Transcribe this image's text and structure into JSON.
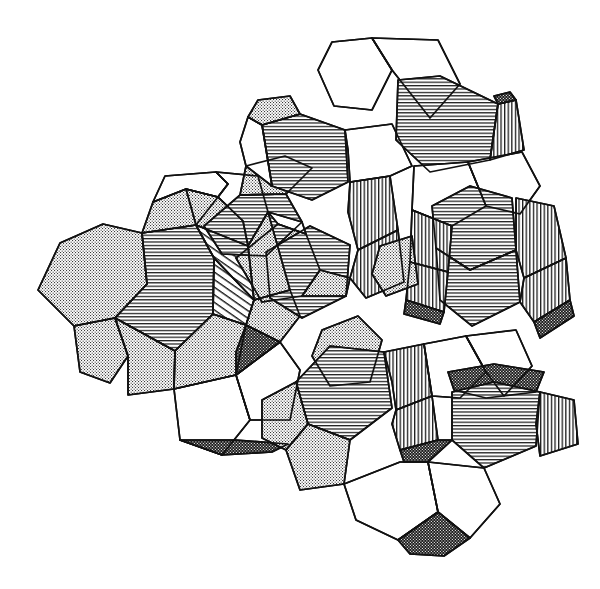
{
  "figure": {
    "title": "Cluster of interpenetrating truncated polyhedra",
    "background_color": "#ffffff",
    "line_color": "#111111",
    "canvas": {
      "width": 600,
      "height": 589
    },
    "drawing_bounds": {
      "left": 37,
      "top": 38,
      "right": 578,
      "bottom": 556
    }
  },
  "legend": {
    "fill_styles": [
      {
        "key": "white",
        "label": "plain white face",
        "color": "#ffffff"
      },
      {
        "key": "stipple",
        "label": "light stipple face",
        "color": "#d9d9d9"
      },
      {
        "key": "horizontal",
        "label": "horizontal hatch face",
        "color": "#2a2a2a"
      },
      {
        "key": "diagonal",
        "label": "diagonal hatch face",
        "color": "#1f1f1f"
      },
      {
        "key": "vertical",
        "label": "vertical hatch face",
        "color": "#1f1f1f"
      },
      {
        "key": "dark",
        "label": "dense dark stipple face",
        "color": "#151515"
      }
    ]
  },
  "chart_data": {
    "type": "diagram",
    "title": "Cluster of interpenetrating truncated polyhedra",
    "cluster_count": 7,
    "clusters": [
      {
        "name": "left-cell",
        "center_x": 150,
        "center_y": 297
      },
      {
        "name": "upper-mid-cell",
        "center_x": 300,
        "center_y": 180
      },
      {
        "name": "top-right-cell",
        "center_x": 440,
        "center_y": 118
      },
      {
        "name": "center-cell",
        "center_x": 262,
        "center_y": 300
      },
      {
        "name": "mid-right-cell",
        "center_x": 390,
        "center_y": 290
      },
      {
        "name": "right-cell",
        "center_x": 500,
        "center_y": 270
      },
      {
        "name": "bottom-cell",
        "center_x": 400,
        "center_y": 440
      }
    ],
    "faces": [
      {
        "id": "f01",
        "fill": "stipple",
        "points": "38,290 60,243 103,224 142,233 147,284 115,318 74,326"
      },
      {
        "id": "f02",
        "fill": "horizontal",
        "points": "115,318 147,284 142,233 196,225 214,258 213,314 175,351"
      },
      {
        "id": "f03",
        "fill": "stipple",
        "points": "142,233 153,202 186,189 218,197 196,225"
      },
      {
        "id": "f04",
        "fill": "stipple",
        "points": "186,189 218,197 243,221 248,246 196,225"
      },
      {
        "id": "f05",
        "fill": "stipple",
        "points": "74,326 115,318 128,356 110,383 80,372"
      },
      {
        "id": "f06",
        "fill": "stipple",
        "points": "115,318 175,351 174,389 128,395 128,356"
      },
      {
        "id": "f07",
        "fill": "stipple",
        "points": "175,351 213,314 246,325 236,375 174,389"
      },
      {
        "id": "f08",
        "fill": "white",
        "points": "153,202 165,176 216,172 228,184 218,197 186,189"
      },
      {
        "id": "f09",
        "fill": "white",
        "points": "216,172 258,176 268,212 248,246 243,221 218,197 228,184"
      },
      {
        "id": "f10",
        "fill": "diagonal",
        "points": "196,225 248,246 254,300 214,258"
      },
      {
        "id": "f11",
        "fill": "diagonal",
        "points": "214,258 254,300 246,325 213,314"
      },
      {
        "id": "f12",
        "fill": "stipple",
        "points": "246,325 254,300 290,290 300,316 280,342"
      },
      {
        "id": "f13",
        "fill": "white",
        "points": "174,389 236,375 250,420 222,455 180,440"
      },
      {
        "id": "f14",
        "fill": "white",
        "points": "236,375 280,342 300,370 290,420 250,420"
      },
      {
        "id": "f15",
        "fill": "dark",
        "points": "180,440 222,455 272,452 288,444 236,440"
      },
      {
        "id": "f16",
        "fill": "stipple",
        "points": "236,258 278,224 306,234 320,270 302,296 262,302"
      },
      {
        "id": "f17",
        "fill": "horizontal",
        "points": "204,226 240,195 286,194 302,222 266,256 222,254"
      },
      {
        "id": "f18",
        "fill": "stipple",
        "points": "240,195 246,166 285,156 312,168 286,194"
      },
      {
        "id": "f19",
        "fill": "horizontal",
        "points": "262,125 300,114 345,130 348,182 312,200 272,186"
      },
      {
        "id": "f20",
        "fill": "white",
        "points": "248,117 262,125 272,186 246,166 240,142"
      },
      {
        "id": "f21",
        "fill": "stipple",
        "points": "248,117 262,125 300,114 290,96 258,100"
      },
      {
        "id": "f22",
        "fill": "horizontal",
        "points": "266,252 310,226 350,245 346,296 302,318 270,298"
      },
      {
        "id": "f23",
        "fill": "vertical",
        "points": "350,182 390,176 398,230 358,250 348,212"
      },
      {
        "id": "f24",
        "fill": "vertical",
        "points": "358,250 398,230 404,282 366,298 350,278"
      },
      {
        "id": "f25",
        "fill": "white",
        "points": "345,130 392,124 412,166 390,176 350,182 348,150"
      },
      {
        "id": "f26",
        "fill": "white",
        "points": "332,42 372,38 392,70 372,110 334,106 318,70"
      },
      {
        "id": "f27",
        "fill": "white",
        "points": "372,38 438,40 460,84 430,118 392,70"
      },
      {
        "id": "f28",
        "fill": "horizontal",
        "points": "398,80 440,76 498,104 490,160 430,172 396,140"
      },
      {
        "id": "f29",
        "fill": "vertical",
        "points": "498,104 516,100 524,150 490,160"
      },
      {
        "id": "f30",
        "fill": "dark",
        "points": "498,104 516,100 510,92 494,96"
      },
      {
        "id": "f31",
        "fill": "white",
        "points": "414,166 468,162 486,206 452,226 412,210"
      },
      {
        "id": "f32",
        "fill": "white",
        "points": "468,162 522,152 540,186 520,214 486,206"
      },
      {
        "id": "f33",
        "fill": "horizontal",
        "points": "432,206 470,186 512,198 516,250 470,270 436,248"
      },
      {
        "id": "f34",
        "fill": "horizontal",
        "points": "436,248 470,270 516,250 520,302 472,326 440,300"
      },
      {
        "id": "f35",
        "fill": "vertical",
        "points": "516,198 554,206 566,258 524,278 516,250"
      },
      {
        "id": "f36",
        "fill": "vertical",
        "points": "524,278 566,258 570,300 534,322 520,302"
      },
      {
        "id": "f37",
        "fill": "vertical",
        "points": "412,210 452,226 448,272 410,262"
      },
      {
        "id": "f38",
        "fill": "vertical",
        "points": "410,262 448,272 444,312 406,300"
      },
      {
        "id": "f39",
        "fill": "stipple",
        "points": "380,246 412,236 418,284 386,296 372,274"
      },
      {
        "id": "f40",
        "fill": "dark",
        "points": "406,300 444,312 440,324 404,314"
      },
      {
        "id": "f41",
        "fill": "dark",
        "points": "534,322 570,300 574,316 540,338"
      },
      {
        "id": "f42",
        "fill": "stipple",
        "points": "322,330 358,316 382,340 370,382 330,386 312,356"
      },
      {
        "id": "f43",
        "fill": "horizontal",
        "points": "296,382 330,346 384,352 392,408 350,440 308,424"
      },
      {
        "id": "f44",
        "fill": "stipple",
        "points": "262,400 296,382 308,424 286,450 262,438"
      },
      {
        "id": "f45",
        "fill": "stipple",
        "points": "286,450 308,424 350,440 344,484 300,490"
      },
      {
        "id": "f46",
        "fill": "vertical",
        "points": "384,352 424,344 432,396 396,410 392,382"
      },
      {
        "id": "f47",
        "fill": "vertical",
        "points": "396,410 432,396 438,440 400,450 392,424"
      },
      {
        "id": "f48",
        "fill": "white",
        "points": "424,344 466,336 486,372 460,398 432,396"
      },
      {
        "id": "f49",
        "fill": "white",
        "points": "466,336 516,330 532,366 504,396 486,372"
      },
      {
        "id": "f50",
        "fill": "dark",
        "points": "448,372 494,364 544,372 536,392 486,398 454,390"
      },
      {
        "id": "f51",
        "fill": "horizontal",
        "points": "452,392 494,382 540,392 536,446 484,468 452,440"
      },
      {
        "id": "f52",
        "fill": "vertical",
        "points": "540,392 574,400 578,444 540,456 536,424"
      },
      {
        "id": "f53",
        "fill": "dark",
        "points": "400,450 438,440 452,440 428,462 404,462"
      },
      {
        "id": "f54",
        "fill": "white",
        "points": "344,484 400,462 428,462 438,512 398,540 356,520"
      },
      {
        "id": "f55",
        "fill": "white",
        "points": "428,462 484,468 500,504 470,538 438,512"
      },
      {
        "id": "f56",
        "fill": "dark",
        "points": "398,540 438,512 470,538 444,556 410,554"
      },
      {
        "id": "f57",
        "fill": "stipple",
        "points": "302,296 320,270 350,278 346,296"
      },
      {
        "id": "f58",
        "fill": "stipple",
        "points": "248,246 268,212 290,290 254,300"
      },
      {
        "id": "f59",
        "fill": "white",
        "points": "268,212 302,222 306,234 278,224"
      },
      {
        "id": "f60",
        "fill": "dark",
        "points": "246,325 280,342 236,375 236,352"
      }
    ]
  }
}
